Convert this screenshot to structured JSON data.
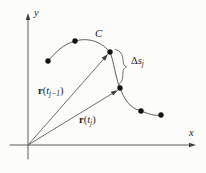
{
  "axes": {
    "x": "x",
    "y": "y"
  },
  "curve": {
    "label": "C"
  },
  "vectors": {
    "r_prev": {
      "symbol": "r",
      "open": "(",
      "var": "t",
      "sub": "j−1",
      "close": ")"
    },
    "r_curr": {
      "symbol": "r",
      "open": "(",
      "var": "t",
      "sub": "j",
      "close": ")"
    }
  },
  "arc_segment": {
    "delta": "Δ",
    "var": "s",
    "sub": "j"
  },
  "colors": {
    "line": "#5d5d5d",
    "arrowhead": "#3f3f3f",
    "dot": "#141414",
    "text": "#1c1c1c",
    "background": "#fcfcfb"
  }
}
